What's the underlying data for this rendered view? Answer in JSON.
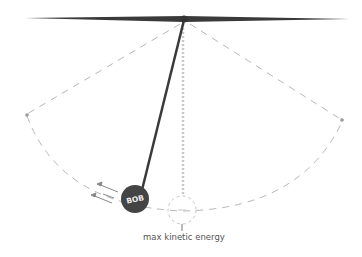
{
  "diagram": {
    "type": "pendulum",
    "bob_label": "BOB",
    "rest_label": "max kinetic energy",
    "colors": {
      "rod": "#3a3a3a",
      "bob": "#444444",
      "dashed": "#b8b8b8",
      "background": "#ffffff"
    }
  }
}
